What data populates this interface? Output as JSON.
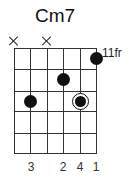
{
  "chord": {
    "name": "Cm7",
    "base_fret_label": "11fr",
    "strings": 6,
    "frets_shown": 5,
    "muted_strings": [
      1,
      3
    ],
    "muted_symbol": "×",
    "dots": [
      {
        "string": 6,
        "fret": 1,
        "finger": "1",
        "root": false
      },
      {
        "string": 4,
        "fret": 2,
        "finger": "2",
        "root": false
      },
      {
        "string": 2,
        "fret": 3,
        "finger": "3",
        "root": false
      },
      {
        "string": 5,
        "fret": 3,
        "finger": "4",
        "root": true
      }
    ],
    "finger_labels": [
      {
        "string": 2,
        "label": "3"
      },
      {
        "string": 4,
        "label": "2"
      },
      {
        "string": 5,
        "label": "4"
      },
      {
        "string": 6,
        "label": "1"
      }
    ]
  }
}
